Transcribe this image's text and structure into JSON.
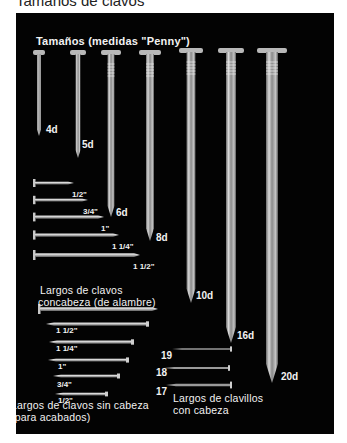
{
  "page_title": "Tamaños de clavos",
  "sections": {
    "penny": {
      "caption": "Tamaños (medidas \"Penny\")",
      "nails": [
        {
          "label": "4d"
        },
        {
          "label": "5d"
        },
        {
          "label": "6d"
        },
        {
          "label": "8d"
        },
        {
          "label": "10d"
        },
        {
          "label": "16d"
        },
        {
          "label": "20d"
        }
      ]
    },
    "common_wire": {
      "caption_line1": "Largos de clavos",
      "caption_line2": "concabeza (de alambre)",
      "nails": [
        {
          "label": "1/2\""
        },
        {
          "label": "3/4\""
        },
        {
          "label": "1\""
        },
        {
          "label": "1 1/4\""
        },
        {
          "label": "1 1/2\""
        }
      ]
    },
    "finishing": {
      "caption_line1": "Largos de clavos sin cabeza",
      "caption_line2": "(para acabados)",
      "nails": [
        {
          "label": "1 1/2\""
        },
        {
          "label": "1 1/4\""
        },
        {
          "label": "1\""
        },
        {
          "label": "3/4\""
        },
        {
          "label": "1/2\""
        }
      ]
    },
    "brads": {
      "caption_line1": "Largos de clavillos",
      "caption_line2": "con cabeza",
      "nails": [
        {
          "label": "19"
        },
        {
          "label": "18"
        },
        {
          "label": "17"
        }
      ]
    }
  }
}
